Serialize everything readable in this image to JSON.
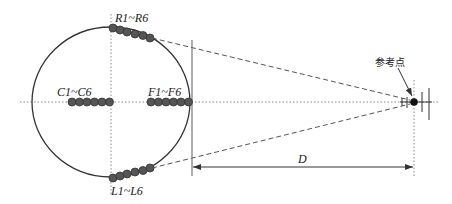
{
  "diagram": {
    "labels": {
      "rear": "R1~R6",
      "center": "C1~C6",
      "front": "F1~F6",
      "left": "L1~L6",
      "reference_point": "参考点",
      "distance": "D"
    },
    "groups": [
      {
        "name": "R",
        "count": 6
      },
      {
        "name": "C",
        "count": 6
      },
      {
        "name": "F",
        "count": 6
      },
      {
        "name": "L",
        "count": 6
      }
    ],
    "colors": {
      "line": "#333333",
      "node_fill": "#555555",
      "axis_dotted": "#888888"
    }
  }
}
